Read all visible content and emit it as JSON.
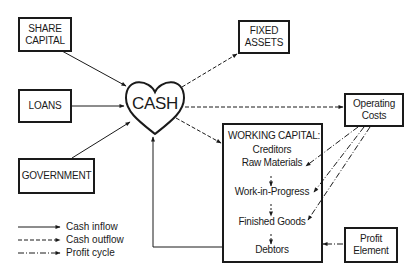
{
  "diagram": {
    "center": {
      "label": "CASH",
      "shape": "heart"
    },
    "sources": [
      {
        "id": "share-capital",
        "lines": [
          "SHARE",
          "CAPITAL"
        ]
      },
      {
        "id": "loans",
        "lines": [
          "LOANS"
        ]
      },
      {
        "id": "government",
        "lines": [
          "GOVERNMENT"
        ]
      }
    ],
    "outputs": {
      "fixed_assets": {
        "lines": [
          "FIXED",
          "ASSETS"
        ]
      },
      "operating_costs": {
        "lines": [
          "Operating",
          "Costs"
        ]
      },
      "profit_element": {
        "lines": [
          "Profit",
          "Element"
        ]
      }
    },
    "working_capital": {
      "title": "WORKING CAPITAL:",
      "items": [
        "Creditors",
        "Raw Materials",
        "Work-in-Progress",
        "Finished Goods",
        "Debtors"
      ]
    },
    "legend": [
      {
        "style": "solid",
        "label": "Cash inflow"
      },
      {
        "style": "dashed",
        "label": "Cash outflow"
      },
      {
        "style": "dash-dot",
        "label": "Profit cycle"
      }
    ],
    "colors": {
      "line": "#1a1a1a",
      "background": "#ffffff"
    }
  }
}
